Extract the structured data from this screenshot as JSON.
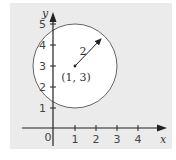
{
  "diagram": {
    "type": "coordinate-plane-circle",
    "background_color": "#ebebeb",
    "axes": {
      "x_label": "x",
      "y_label": "y",
      "origin_label": "0",
      "x_ticks": [
        "1",
        "2",
        "3",
        "4"
      ],
      "y_ticks": [
        "1",
        "2",
        "3",
        "4",
        "5"
      ]
    },
    "circle": {
      "center": [
        1,
        3
      ],
      "center_label": "(1, 3)",
      "radius": 2,
      "radius_label": "2",
      "fill": "#ffffff",
      "stroke": "#555555"
    }
  }
}
